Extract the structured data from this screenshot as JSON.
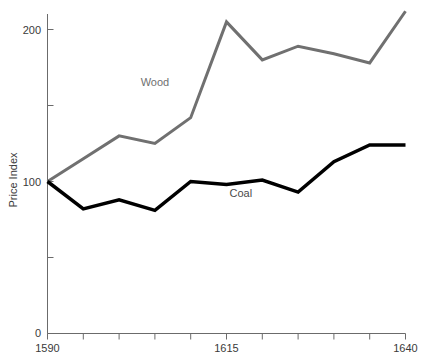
{
  "chart_data": {
    "type": "line",
    "title": "",
    "subtitle": "",
    "xlabel": "",
    "ylabel": "Price Index",
    "x": [
      1590,
      1595,
      1600,
      1605,
      1610,
      1615,
      1620,
      1625,
      1630,
      1635,
      1640
    ],
    "xlim": [
      1590,
      1640
    ],
    "ylim": [
      0,
      215
    ],
    "grid": false,
    "legend_position": "inline-annotations",
    "x_tick_values": [
      1590,
      1595,
      1600,
      1605,
      1610,
      1615,
      1620,
      1625,
      1630,
      1635,
      1640
    ],
    "x_tick_labels": [
      "1590",
      "",
      "",
      "",
      "",
      "1615",
      "",
      "",
      "",
      "",
      "1640"
    ],
    "y_tick_values": [
      0,
      50,
      100,
      150,
      200
    ],
    "y_tick_labels": [
      "0",
      "",
      "100",
      "",
      "200"
    ],
    "series": [
      {
        "name": "Wood",
        "color": "#707070",
        "stroke_width": 3,
        "label_x": 1605,
        "label_y": 163,
        "values": [
          100,
          115,
          130,
          125,
          142,
          205,
          180,
          189,
          184,
          178,
          212
        ]
      },
      {
        "name": "Coal",
        "color": "#000000",
        "stroke_width": 3.5,
        "label_x": 1617,
        "label_y": 90,
        "values": [
          100,
          82,
          88,
          81,
          100,
          98,
          101,
          93,
          113,
          124,
          124
        ]
      }
    ],
    "annotations": [
      {
        "text": "Wood",
        "color": "#707070"
      },
      {
        "text": "Coal",
        "color": "#4a4a4a"
      }
    ]
  },
  "axes": {
    "y_axis_title": "Price Index",
    "y_labels": {
      "zero": "0",
      "hundred": "100",
      "two_hundred": "200"
    },
    "x_labels": {
      "start": "1590",
      "middle": "1615",
      "end": "1640"
    }
  }
}
